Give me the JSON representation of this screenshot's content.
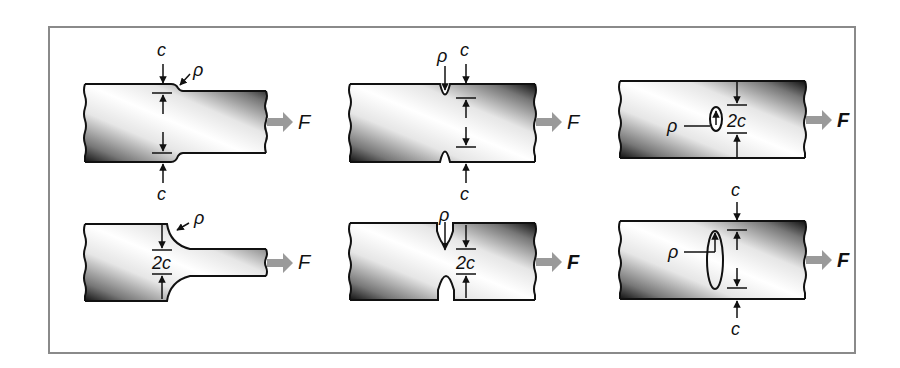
{
  "figure": {
    "labels": {
      "half_width": "c",
      "full_width": "2c",
      "radius": "ρ",
      "force": "F"
    },
    "panels": [
      {
        "id": "shoulder-step",
        "row": 1,
        "col": 1,
        "dimension": "c",
        "force": "F"
      },
      {
        "id": "edge-notches",
        "row": 1,
        "col": 2,
        "dimension": "c",
        "force": "F"
      },
      {
        "id": "small-elliptical-hole",
        "row": 1,
        "col": 3,
        "dimension": "2c",
        "force": "F"
      },
      {
        "id": "fillet-shoulder",
        "row": 2,
        "col": 1,
        "dimension": "2c",
        "force": "F"
      },
      {
        "id": "deep-u-notches",
        "row": 2,
        "col": 2,
        "dimension": "2c",
        "force": "F"
      },
      {
        "id": "large-elliptical-hole",
        "row": 2,
        "col": 3,
        "dimension": "c",
        "force": "F"
      }
    ],
    "colors": {
      "frame": "#8a8a8a",
      "arrow": "#9a9a9a",
      "ink": "#111111"
    }
  }
}
